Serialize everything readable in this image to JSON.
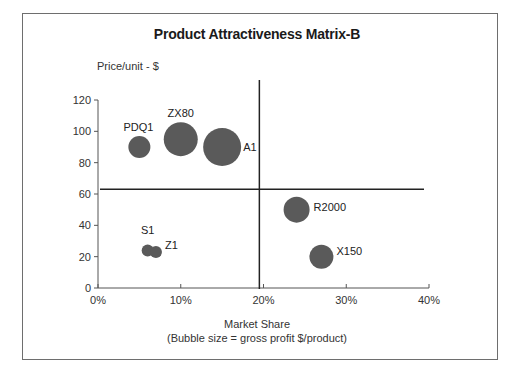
{
  "chart_data": {
    "type": "scatter",
    "subtype": "bubble",
    "title": "Product Attractiveness Matrix-B",
    "xlabel": "Market Share",
    "xlabel_note": "(Bubble size = gross profit $/product)",
    "ylabel": "Price/unit - $",
    "xlim": [
      0,
      40
    ],
    "ylim": [
      0,
      120
    ],
    "x_ticks": [
      "0%",
      "10%",
      "20%",
      "30%",
      "40%"
    ],
    "y_ticks": [
      "0",
      "20",
      "40",
      "60",
      "80",
      "100",
      "120"
    ],
    "grid": false,
    "legend": null,
    "quadrant_dividers": {
      "x": 19.5,
      "y": 63
    },
    "points": [
      {
        "label": "PDQ1",
        "x": 5,
        "y": 90,
        "size": 11
      },
      {
        "label": "ZX80",
        "x": 10,
        "y": 95,
        "size": 17
      },
      {
        "label": "A1",
        "x": 15,
        "y": 90,
        "size": 19
      },
      {
        "label": "S1",
        "x": 6,
        "y": 24,
        "size": 6
      },
      {
        "label": "Z1",
        "x": 7,
        "y": 23,
        "size": 6
      },
      {
        "label": "R2000",
        "x": 24,
        "y": 50,
        "size": 13
      },
      {
        "label": "X150",
        "x": 27,
        "y": 20,
        "size": 12
      }
    ],
    "colors": {
      "bubble": "#5a5a5a",
      "axis": "#555555",
      "divider": "#222222"
    }
  }
}
